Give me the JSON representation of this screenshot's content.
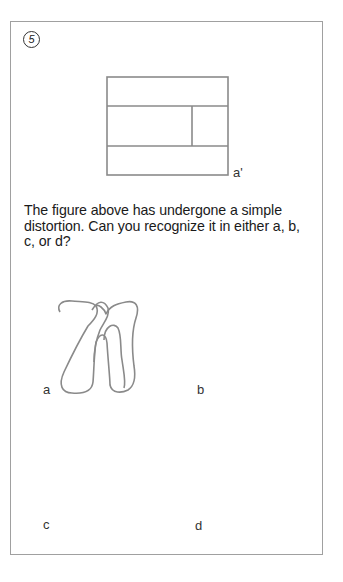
{
  "puzzle": {
    "number": "5",
    "reference_label": "a'",
    "question": "The figure above has undergone a simple distortion. Can you recognize it in either a, b, c, or d?",
    "options": [
      {
        "label": "a"
      },
      {
        "label": "b"
      },
      {
        "label": "c"
      },
      {
        "label": "d"
      }
    ]
  },
  "colors": {
    "frame": "#a0a0a0",
    "figure_stroke": "#8a8a8a",
    "text": "#1a1a1a"
  }
}
